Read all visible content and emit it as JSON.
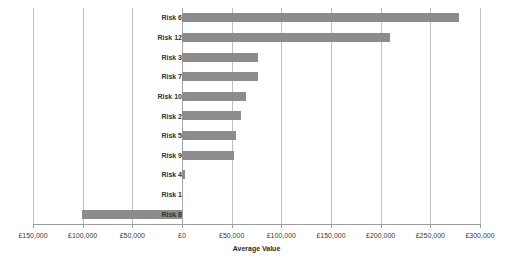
{
  "chart_data": {
    "type": "bar",
    "orientation": "horizontal",
    "title": "",
    "xlabel": "Average Value",
    "ylabel": "",
    "categories": [
      "Risk 6",
      "Risk 12",
      "Risk 3",
      "Risk 7",
      "Risk 10",
      "Risk 2",
      "Risk 5",
      "Risk 9",
      "Risk 4",
      "Risk 1",
      "Risk 8"
    ],
    "values": [
      278700,
      209200,
      76500,
      76500,
      64400,
      59400,
      54300,
      52300,
      3000,
      0,
      -100500
    ],
    "xlim": [
      -150000,
      300000
    ],
    "xticks": [
      -150000,
      -100000,
      -50000,
      0,
      50000,
      100000,
      150000,
      200000,
      250000,
      300000
    ],
    "xticklabels": [
      "£150,000",
      "£100,000",
      "£50,000",
      "£0",
      "£50,000",
      "£100,000",
      "£150,000",
      "£200,000",
      "£250,000",
      "£300,000"
    ],
    "grid": "vertical",
    "legend": "none",
    "bar_color": "#8c8c8c",
    "gridline_color": "#bfbfbf",
    "axis_color": "#9c9c9c"
  }
}
